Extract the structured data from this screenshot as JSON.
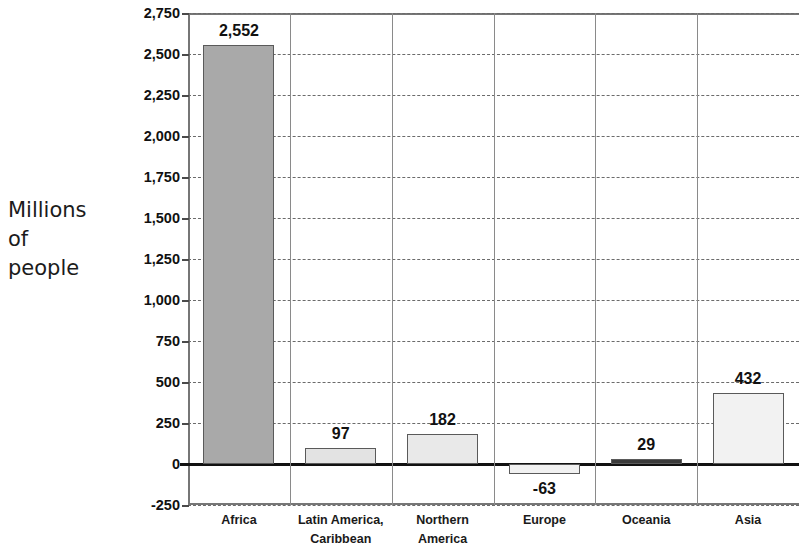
{
  "chart_data": {
    "type": "bar",
    "title": "",
    "subtitle": "",
    "xlabel": "",
    "ylabel": "Millions of people",
    "ylabel_lines": [
      "Millions",
      "of",
      "people"
    ],
    "categories": [
      "Africa",
      "Latin America, Caribbean",
      "Northern America",
      "Europe",
      "Oceania",
      "Asia"
    ],
    "category_lines": [
      [
        "Africa"
      ],
      [
        "Latin America,",
        "Caribbean"
      ],
      [
        "Northern",
        "America"
      ],
      [
        "Europe"
      ],
      [
        "Oceania"
      ],
      [
        "Asia"
      ]
    ],
    "values": [
      2552,
      97,
      182,
      -63,
      29,
      432
    ],
    "value_labels": [
      "2,552",
      "97",
      "182",
      "-63",
      "29",
      "432"
    ],
    "ylim": [
      -250,
      2750
    ],
    "ytick_values": [
      2750,
      2500,
      2250,
      2000,
      1750,
      1500,
      1250,
      1000,
      750,
      500,
      250,
      0,
      -250
    ],
    "ytick_labels": [
      "2,750",
      "2,500",
      "2,250",
      "2,000",
      "1,750",
      "1,500",
      "1,250",
      "1,000",
      "750",
      "500",
      "250",
      "0",
      "-250"
    ],
    "grid": true,
    "grid_style": "dashed-horizontal",
    "legend": "none",
    "bar_colors": [
      "#a9a9a9",
      "#e3e3e3",
      "#e9e9e9",
      "#f1f1f1",
      "#3a3a3a",
      "#f2f2f2"
    ],
    "bar_border_color": "#5a5a5a",
    "zero_line_color": "#111111",
    "axis_color": "#767676",
    "text_color": "#111111"
  }
}
